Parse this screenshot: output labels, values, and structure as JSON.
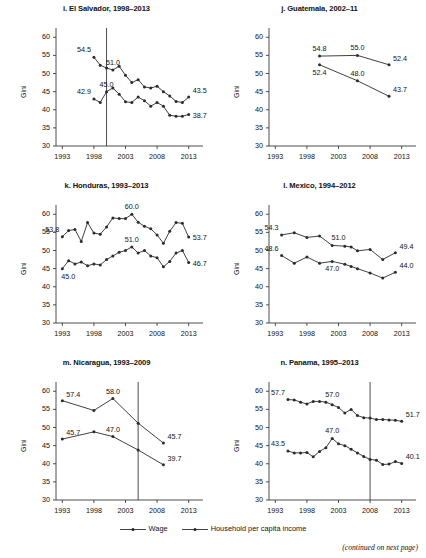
{
  "figure": {
    "legend": [
      {
        "key": "wage",
        "label": "Wage"
      },
      {
        "key": "household",
        "label": "Household per capita income"
      }
    ],
    "footer": "(continued on next page)",
    "ylabel": "Gini",
    "yticks": [
      30,
      35,
      40,
      45,
      50,
      55,
      60
    ],
    "xticks": [
      1993,
      1998,
      2003,
      2008,
      2013
    ]
  },
  "chart_data": [
    {
      "type": "line",
      "panel": "i",
      "title": "i. El Salvador, 1998–2013",
      "xlabel": "",
      "ylabel": "Gini",
      "ylim": [
        30,
        62
      ],
      "xlim": [
        1992,
        2014
      ],
      "grid": false,
      "legend_position": "figure-bottom",
      "vline": 2000,
      "xticks": [
        1993,
        1998,
        2003,
        2008,
        2013
      ],
      "yticks": [
        30,
        35,
        40,
        45,
        50,
        55,
        60
      ],
      "series": [
        {
          "name": "Household per capita income",
          "x": [
            1998,
            1999,
            2000,
            2001,
            2002,
            2003,
            2004,
            2005,
            2006,
            2007,
            2008,
            2009,
            2010,
            2011,
            2012,
            2013
          ],
          "values": [
            54.5,
            52.3,
            51.5,
            51.0,
            52.0,
            49.5,
            47.5,
            48.3,
            46.3,
            46.0,
            46.5,
            45.0,
            43.8,
            42.3,
            42.0,
            43.5
          ]
        },
        {
          "name": "Wage",
          "x": [
            1998,
            1999,
            2000,
            2001,
            2002,
            2003,
            2004,
            2005,
            2006,
            2007,
            2008,
            2009,
            2010,
            2011,
            2012,
            2013
          ],
          "values": [
            43.0,
            42.0,
            45.0,
            46.0,
            44.3,
            42.2,
            42.0,
            43.5,
            42.5,
            41.0,
            42.0,
            41.0,
            38.5,
            38.2,
            38.2,
            38.7
          ]
        }
      ],
      "annotations": [
        {
          "text": "54.5",
          "x": 1998,
          "y": 54.5,
          "pos": "above-left"
        },
        {
          "text": "51.0",
          "x": 2001,
          "y": 51.0,
          "pos": "above"
        },
        {
          "text": "43.5",
          "x": 2013,
          "y": 43.5,
          "pos": "above-right"
        },
        {
          "text": "42.9",
          "x": 1998,
          "y": 43.0,
          "pos": "above-left"
        },
        {
          "text": "45.0",
          "x": 2000,
          "y": 45.0,
          "pos": "above"
        },
        {
          "text": "38.7",
          "x": 2013,
          "y": 38.7,
          "pos": "right"
        }
      ]
    },
    {
      "type": "line",
      "panel": "j",
      "title": "j. Guatemala, 2002–11",
      "xlabel": "",
      "ylabel": "Gini",
      "ylim": [
        30,
        62
      ],
      "xlim": [
        1992,
        2014
      ],
      "grid": false,
      "legend_position": "figure-bottom",
      "vline": null,
      "xticks": [
        1993,
        1998,
        2003,
        2008,
        2013
      ],
      "yticks": [
        30,
        35,
        40,
        45,
        50,
        55,
        60
      ],
      "series": [
        {
          "name": "Household per capita income",
          "x": [
            2000,
            2006,
            2011
          ],
          "values": [
            54.8,
            55.0,
            52.4
          ]
        },
        {
          "name": "Wage",
          "x": [
            2000,
            2006,
            2011
          ],
          "values": [
            52.4,
            48.0,
            43.7
          ]
        }
      ],
      "annotations": [
        {
          "text": "54.8",
          "x": 2000,
          "y": 54.8,
          "pos": "above"
        },
        {
          "text": "55.0",
          "x": 2006,
          "y": 55.0,
          "pos": "above"
        },
        {
          "text": "52.4",
          "x": 2011,
          "y": 52.4,
          "pos": "above-right"
        },
        {
          "text": "52.4",
          "x": 2000,
          "y": 52.4,
          "pos": "below"
        },
        {
          "text": "48.0",
          "x": 2006,
          "y": 48.0,
          "pos": "above"
        },
        {
          "text": "43.7",
          "x": 2011,
          "y": 43.7,
          "pos": "above-right"
        }
      ]
    },
    {
      "type": "line",
      "panel": "k",
      "title": "k. Honduras, 1993–2013",
      "xlabel": "",
      "ylabel": "Gini",
      "ylim": [
        30,
        62
      ],
      "xlim": [
        1992,
        2014
      ],
      "grid": false,
      "legend_position": "figure-bottom",
      "vline": null,
      "xticks": [
        1993,
        1998,
        2003,
        2008,
        2013
      ],
      "yticks": [
        30,
        35,
        40,
        45,
        50,
        55,
        60
      ],
      "series": [
        {
          "name": "Household per capita income",
          "x": [
            1993,
            1994,
            1995,
            1996,
            1997,
            1998,
            1999,
            2000,
            2001,
            2002,
            2003,
            2004,
            2005,
            2006,
            2007,
            2008,
            2009,
            2010,
            2011,
            2012,
            2013
          ],
          "values": [
            53.8,
            55.5,
            55.8,
            52.5,
            57.7,
            54.8,
            54.5,
            56.5,
            59.0,
            58.8,
            58.8,
            60.0,
            57.8,
            56.7,
            56.0,
            54.3,
            52.0,
            55.3,
            57.7,
            57.5,
            53.7
          ]
        },
        {
          "name": "Wage",
          "x": [
            1993,
            1994,
            1995,
            1996,
            1997,
            1998,
            1999,
            2000,
            2001,
            2002,
            2003,
            2004,
            2005,
            2006,
            2007,
            2008,
            2009,
            2010,
            2011,
            2012,
            2013
          ],
          "values": [
            45.0,
            47.2,
            46.3,
            46.8,
            45.8,
            46.3,
            46.0,
            47.5,
            48.5,
            49.5,
            50.0,
            51.0,
            49.3,
            50.0,
            48.5,
            48.0,
            45.5,
            47.0,
            49.3,
            50.0,
            46.7
          ]
        }
      ],
      "annotations": [
        {
          "text": "53.8",
          "x": 1993,
          "y": 53.8,
          "pos": "above-left"
        },
        {
          "text": "60.0",
          "x": 2004,
          "y": 60.0,
          "pos": "above"
        },
        {
          "text": "53.7",
          "x": 2013,
          "y": 53.7,
          "pos": "right"
        },
        {
          "text": "45.0",
          "x": 1993,
          "y": 45.0,
          "pos": "below-left"
        },
        {
          "text": "51.0",
          "x": 2004,
          "y": 51.0,
          "pos": "above"
        },
        {
          "text": "46.7",
          "x": 2013,
          "y": 46.7,
          "pos": "right"
        }
      ]
    },
    {
      "type": "line",
      "panel": "l",
      "title": "l. Mexico, 1994–2012",
      "xlabel": "",
      "ylabel": "Gini",
      "ylim": [
        30,
        62
      ],
      "xlim": [
        1992,
        2014
      ],
      "grid": false,
      "legend_position": "figure-bottom",
      "vline": null,
      "xticks": [
        1993,
        1998,
        2003,
        2008,
        2013
      ],
      "yticks": [
        30,
        35,
        40,
        45,
        50,
        55,
        60
      ],
      "series": [
        {
          "name": "Household per capita income",
          "x": [
            1994,
            1996,
            1998,
            2000,
            2002,
            2004,
            2005,
            2006,
            2008,
            2010,
            2012
          ],
          "values": [
            54.3,
            54.9,
            53.6,
            54.0,
            51.4,
            51.2,
            51.0,
            49.9,
            50.3,
            47.5,
            49.4
          ]
        },
        {
          "name": "Wage",
          "x": [
            1994,
            1996,
            1998,
            2000,
            2002,
            2004,
            2005,
            2006,
            2008,
            2010,
            2012
          ],
          "values": [
            48.6,
            46.5,
            48.2,
            46.5,
            47.0,
            46.2,
            45.6,
            45.0,
            43.8,
            42.4,
            44.0
          ]
        }
      ],
      "annotations": [
        {
          "text": "54.3",
          "x": 1994,
          "y": 54.3,
          "pos": "above-left"
        },
        {
          "text": "51.0",
          "x": 2003,
          "y": 51.4,
          "pos": "above"
        },
        {
          "text": "49.4",
          "x": 2012,
          "y": 49.4,
          "pos": "above-right"
        },
        {
          "text": "48.6",
          "x": 1994,
          "y": 48.6,
          "pos": "above-left"
        },
        {
          "text": "47.0",
          "x": 2002,
          "y": 47.0,
          "pos": "below"
        },
        {
          "text": "44.0",
          "x": 2012,
          "y": 44.0,
          "pos": "above-right"
        }
      ]
    },
    {
      "type": "line",
      "panel": "m",
      "title": "m. Nicaragua, 1993–2009",
      "xlabel": "",
      "ylabel": "Gini",
      "ylim": [
        30,
        62
      ],
      "xlim": [
        1992,
        2014
      ],
      "grid": false,
      "legend_position": "figure-bottom",
      "vline": 2005,
      "xticks": [
        1993,
        1998,
        2003,
        2008,
        2013
      ],
      "yticks": [
        30,
        35,
        40,
        45,
        50,
        55,
        60
      ],
      "series": [
        {
          "name": "Household per capita income",
          "x": [
            1993,
            1998,
            2001,
            2005,
            2009
          ],
          "values": [
            57.4,
            54.7,
            58.0,
            51.2,
            45.7
          ]
        },
        {
          "name": "Wage",
          "x": [
            1993,
            1998,
            2001,
            2005,
            2009
          ],
          "values": [
            46.8,
            48.8,
            47.5,
            43.8,
            39.7
          ]
        }
      ],
      "annotations": [
        {
          "text": "57.4",
          "x": 1993,
          "y": 57.4,
          "pos": "above-right"
        },
        {
          "text": "58.0",
          "x": 2001,
          "y": 58.0,
          "pos": "above"
        },
        {
          "text": "45.7",
          "x": 2009,
          "y": 45.7,
          "pos": "above-right"
        },
        {
          "text": "45.7",
          "x": 1993,
          "y": 46.8,
          "pos": "above-right"
        },
        {
          "text": "47.0",
          "x": 2001,
          "y": 47.5,
          "pos": "above"
        },
        {
          "text": "39.7",
          "x": 2009,
          "y": 39.7,
          "pos": "above-right"
        }
      ]
    },
    {
      "type": "line",
      "panel": "n",
      "title": "n. Panama, 1995–2013",
      "xlabel": "",
      "ylabel": "Gini",
      "ylim": [
        30,
        62
      ],
      "xlim": [
        1992,
        2014
      ],
      "grid": false,
      "legend_position": "figure-bottom",
      "vline": 2008,
      "xticks": [
        1993,
        1998,
        2003,
        2008,
        2013
      ],
      "yticks": [
        30,
        35,
        40,
        45,
        50,
        55,
        60
      ],
      "series": [
        {
          "name": "Household per capita income",
          "x": [
            1995,
            1996,
            1997,
            1998,
            1999,
            2000,
            2001,
            2002,
            2003,
            2004,
            2005,
            2006,
            2007,
            2008,
            2009,
            2010,
            2011,
            2012,
            2013
          ],
          "values": [
            57.7,
            57.6,
            57.0,
            56.5,
            57.2,
            57.2,
            57.0,
            56.3,
            55.5,
            54.0,
            55.0,
            53.3,
            52.7,
            52.6,
            52.2,
            52.2,
            52.1,
            52.0,
            51.7
          ]
        },
        {
          "name": "Wage",
          "x": [
            1995,
            1996,
            1997,
            1998,
            1999,
            2000,
            2001,
            2002,
            2003,
            2004,
            2005,
            2006,
            2007,
            2008,
            2009,
            2010,
            2011,
            2012,
            2013
          ],
          "values": [
            43.5,
            43.0,
            43.0,
            43.1,
            41.9,
            43.4,
            44.4,
            47.0,
            45.5,
            45.0,
            44.0,
            43.0,
            42.0,
            41.2,
            41.0,
            39.8,
            39.9,
            40.6,
            40.1
          ]
        }
      ],
      "annotations": [
        {
          "text": "57.7",
          "x": 1995,
          "y": 57.7,
          "pos": "above-left"
        },
        {
          "text": "57.0",
          "x": 2002,
          "y": 57.0,
          "pos": "above"
        },
        {
          "text": "51.7",
          "x": 2013,
          "y": 51.7,
          "pos": "above-right"
        },
        {
          "text": "43.5",
          "x": 1995,
          "y": 43.5,
          "pos": "above-left"
        },
        {
          "text": "47.0",
          "x": 2002,
          "y": 47.0,
          "pos": "above"
        },
        {
          "text": "40.1",
          "x": 2013,
          "y": 40.1,
          "pos": "above-right"
        }
      ]
    }
  ]
}
